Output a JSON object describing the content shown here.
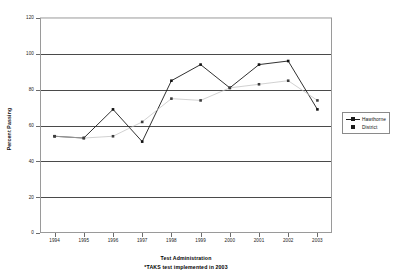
{
  "chart_data": {
    "type": "line",
    "title": "",
    "xlabel": "Test Administration",
    "ylabel": "Percent Passing",
    "note": "*TAKS test implemented in 2003",
    "categories": [
      "1994",
      "1995",
      "1996",
      "1997",
      "1998",
      "1999",
      "2000",
      "2001",
      "2002",
      "2003"
    ],
    "series": [
      {
        "name": "Hawthorne",
        "values": [
          54,
          53,
          69,
          51,
          85,
          94,
          81,
          94,
          96,
          69
        ],
        "color": "#1a1a1a",
        "marker": "square",
        "line": "solid"
      },
      {
        "name": "District",
        "values": [
          54,
          53,
          54,
          62,
          75,
          74,
          81,
          83,
          85,
          74
        ],
        "color": "#4d4d4d",
        "marker": "square",
        "line": "light"
      }
    ],
    "ylim": [
      0,
      120
    ],
    "ytick_labels": [
      "120",
      "100",
      "80",
      "60",
      "40",
      "20",
      "0"
    ],
    "ytick_values": [
      120,
      100,
      80,
      60,
      40,
      20,
      0
    ],
    "grid": true,
    "legend_position": "right"
  },
  "legend": {
    "entries": [
      {
        "label": "Hawthorne"
      },
      {
        "label": "District"
      }
    ]
  }
}
